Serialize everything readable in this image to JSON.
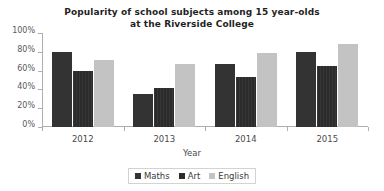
{
  "chart_data": {
    "type": "bar",
    "title": "Popularity of school subjects among 15 year-olds at the Riverside College",
    "title_line1": "Popularity of school subjects among 15 year-olds",
    "title_line2": "at the Riverside College",
    "xlabel": "Year",
    "ylabel": "",
    "categories": [
      "2012",
      "2013",
      "2014",
      "2015"
    ],
    "series": [
      {
        "name": "Maths",
        "color": "#333333",
        "values": [
          80,
          35,
          67,
          80
        ]
      },
      {
        "name": "Art",
        "color": "#2b2b2b",
        "values": [
          60,
          42,
          53,
          65
        ]
      },
      {
        "name": "English",
        "color": "#c3c3c3",
        "values": [
          71,
          67,
          79,
          88
        ]
      }
    ],
    "ylim": [
      0,
      100
    ],
    "ytick_labels": [
      "100%",
      "80%",
      "60%",
      "40%",
      "20%",
      "0%"
    ],
    "ytick_values": [
      100,
      80,
      60,
      40,
      20,
      0
    ],
    "grid": false,
    "legend_position": "bottom"
  }
}
